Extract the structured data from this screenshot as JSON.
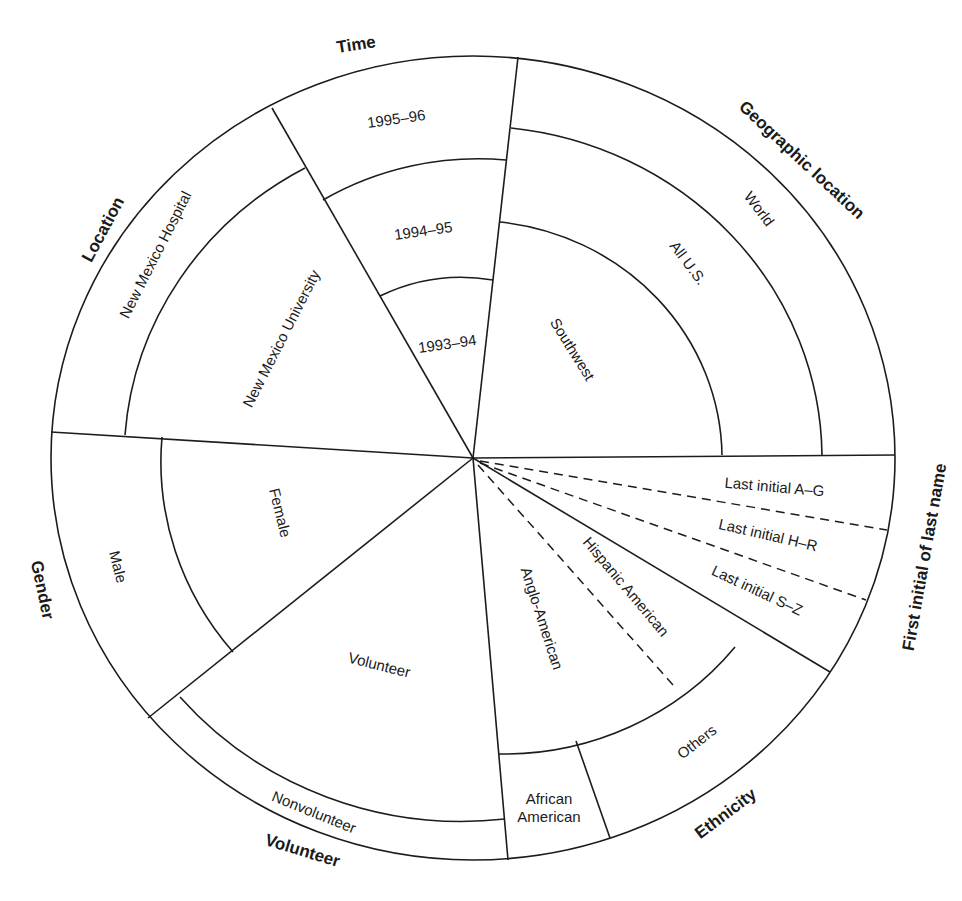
{
  "diagram": {
    "type": "sampling-frame-wheel",
    "center": [
      473,
      458
    ],
    "outer_radius": 422,
    "vertical_scale": 0.953,
    "line_color": "#1c1c1c",
    "background": "#ffffff"
  },
  "sectors": {
    "time": {
      "header": "Time",
      "rings": [
        "1993–94",
        "1994–95",
        "1995–96"
      ]
    },
    "geographic": {
      "header": "Geographic location",
      "rings": [
        "Southwest",
        "All U.S.",
        "World"
      ]
    },
    "first_initial": {
      "header": "First initial of last name",
      "slices": [
        "Last initial A–G",
        "Last initial H–R",
        "Last initial S–Z"
      ]
    },
    "ethnicity": {
      "header": "Ethnicity",
      "inner": [
        "Anglo-American",
        "Hispanic American"
      ],
      "outer": [
        "African American",
        "Others"
      ],
      "african_line1": "African",
      "african_line2": "American"
    },
    "volunteer": {
      "header": "Volunteer",
      "rings": [
        "Volunteer",
        "Nonvolunteer"
      ]
    },
    "gender": {
      "header": "Gender",
      "rings": [
        "Female",
        "Male"
      ]
    },
    "location": {
      "header": "Location",
      "rings": [
        "New Mexico University",
        "New Mexico Hospital"
      ]
    }
  }
}
